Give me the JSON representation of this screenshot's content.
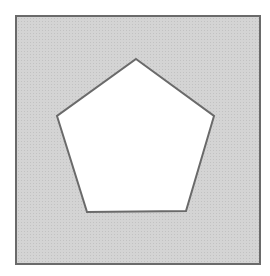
{
  "figure": {
    "canvas": {
      "width": 270,
      "height": 276,
      "background": "#ffffff"
    },
    "square": {
      "x": 16,
      "y": 16,
      "width": 244,
      "height": 248,
      "fill": "#d9d9d9",
      "stroke": "#6a6a6a",
      "stroke_width": 2
    },
    "pentagon": {
      "points": "136,59 214,116 186,211 87,212 57,116",
      "fill": "#ffffff",
      "stroke": "#6a6a6a",
      "stroke_width": 2
    }
  }
}
